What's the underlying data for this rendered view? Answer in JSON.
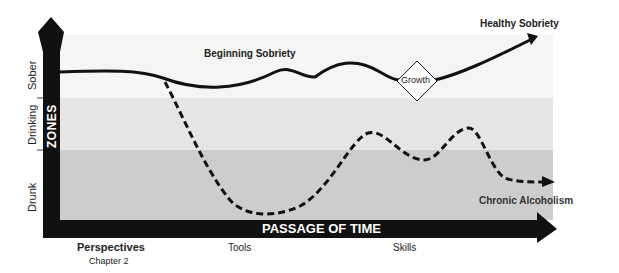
{
  "diagram": {
    "y_axis": {
      "title": "ZONES",
      "zones": [
        "Sober",
        "Drinking",
        "Drunk"
      ]
    },
    "x_axis": {
      "title": "PASSAGE OF TIME",
      "stages": [
        "Perspectives",
        "Tools",
        "Skills"
      ],
      "stage_subtitle": "Chapter 2"
    },
    "paths": {
      "solid": {
        "label_start": "Beginning Sobriety",
        "label_end": "Healthy Sobriety",
        "milestone": "Growth"
      },
      "dashed": {
        "label_end": "Chronic Alcoholism"
      }
    },
    "colors": {
      "sober_band": "#f6f6f6",
      "drinking_band": "#e6e6e6",
      "drunk_band": "#cccccc",
      "axis": "#111111"
    }
  }
}
